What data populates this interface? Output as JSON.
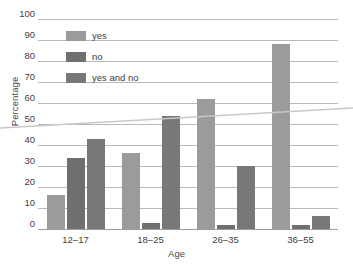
{
  "chart_data": {
    "type": "bar",
    "title": "",
    "xlabel": "Age",
    "ylabel": "Percentage",
    "categories": [
      "12–17",
      "18–25",
      "26–35",
      "36–55"
    ],
    "series": [
      {
        "name": "yes",
        "color": "#9b9b9b",
        "values": [
          16,
          36,
          62,
          88
        ]
      },
      {
        "name": "no",
        "color": "#6f6f6f",
        "values": [
          34,
          3,
          2,
          2
        ]
      },
      {
        "name": "yes and no",
        "color": "#787878",
        "values": [
          43,
          54,
          30,
          6
        ]
      }
    ],
    "ylim": [
      0,
      100
    ],
    "yticks": [
      0,
      10,
      20,
      30,
      40,
      50,
      60,
      70,
      80,
      90,
      100
    ],
    "ytick_labels": [
      "0",
      "10",
      "20",
      "30",
      "40",
      "50",
      "60",
      "70",
      "80",
      "90",
      "100"
    ],
    "grid": true,
    "legend_position": "upper-left-inside"
  },
  "legend": {
    "items": [
      {
        "label": "yes"
      },
      {
        "label": "no"
      },
      {
        "label": "yes and no"
      }
    ]
  },
  "axes": {
    "y_title": "Percentage",
    "x_title": "Age"
  }
}
